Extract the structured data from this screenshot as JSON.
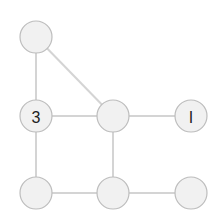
{
  "diagram": {
    "type": "graph-puzzle",
    "colors": {
      "node_fill": "#f1f1f1",
      "node_stroke": "#bdbdbd",
      "edge": "#d4d4d4",
      "label": "#222222"
    },
    "nodes": [
      {
        "id": "n1",
        "x": 36,
        "y": 37,
        "label": ""
      },
      {
        "id": "n2",
        "x": 36,
        "y": 116,
        "label": "3"
      },
      {
        "id": "n3",
        "x": 113,
        "y": 116,
        "label": ""
      },
      {
        "id": "n4",
        "x": 191,
        "y": 116,
        "label": "I"
      },
      {
        "id": "n5",
        "x": 36,
        "y": 193,
        "label": ""
      },
      {
        "id": "n6",
        "x": 113,
        "y": 193,
        "label": ""
      },
      {
        "id": "n7",
        "x": 191,
        "y": 193,
        "label": ""
      }
    ],
    "edges": [
      {
        "from": "n1",
        "to": "n2"
      },
      {
        "from": "n1",
        "to": "n3"
      },
      {
        "from": "n2",
        "to": "n3"
      },
      {
        "from": "n3",
        "to": "n4"
      },
      {
        "from": "n2",
        "to": "n5"
      },
      {
        "from": "n3",
        "to": "n6"
      },
      {
        "from": "n5",
        "to": "n6"
      },
      {
        "from": "n6",
        "to": "n7"
      }
    ],
    "node_radius": 16
  }
}
